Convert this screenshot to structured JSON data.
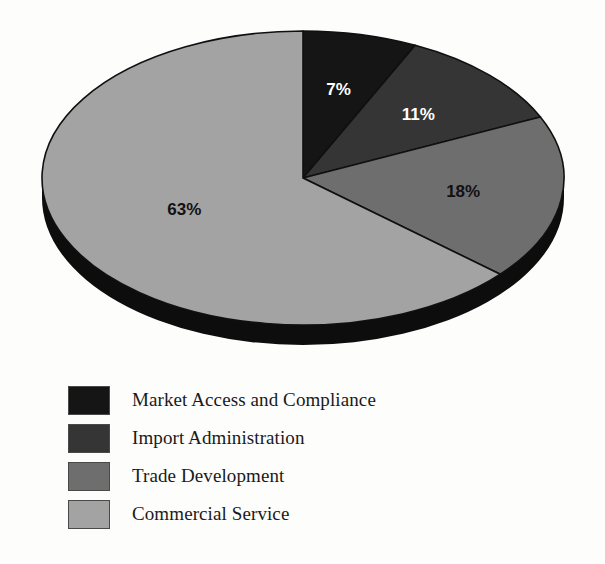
{
  "background_color": "#fdfdfc",
  "chart_data": {
    "type": "pie",
    "title": "",
    "subtitle": "",
    "xlabel": "",
    "ylabel": "",
    "grid": false,
    "legend_position": "bottom-left",
    "three_d": true,
    "start_angle_deg": 90,
    "direction": "clockwise",
    "categories": [
      "Market Access and Compliance",
      "Import Administration",
      "Trade Development",
      "Commercial Service"
    ],
    "values": [
      7,
      11,
      18,
      63
    ],
    "value_unit": "%",
    "data_labels": [
      "7%",
      "11%",
      "18%",
      "63%"
    ],
    "colors": [
      "#151515",
      "#353535",
      "#6e6e6e",
      "#a3a3a3"
    ],
    "label_text_colors": [
      "#ffffff",
      "#ffffff",
      "#111111",
      "#111111"
    ],
    "slices": [
      {
        "label": "7%",
        "value": 7,
        "category": "Market Access and Compliance",
        "color": "#151515",
        "text_color": "#ffffff"
      },
      {
        "label": "11%",
        "value": 11,
        "category": "Import Administration",
        "color": "#353535",
        "text_color": "#ffffff"
      },
      {
        "label": "18%",
        "value": 18,
        "category": "Trade Development",
        "color": "#6e6e6e",
        "text_color": "#111111"
      },
      {
        "label": "63%",
        "value": 63,
        "category": "Commercial Service",
        "color": "#a3a3a3",
        "text_color": "#111111"
      }
    ],
    "side_wall_color": "#0d0d0d"
  },
  "legend": {
    "items": [
      {
        "label": "Market Access and Compliance",
        "color": "#151515"
      },
      {
        "label": "Import Administration",
        "color": "#353535"
      },
      {
        "label": "Trade Development",
        "color": "#6e6e6e"
      },
      {
        "label": "Commercial Service",
        "color": "#a3a3a3"
      }
    ]
  }
}
